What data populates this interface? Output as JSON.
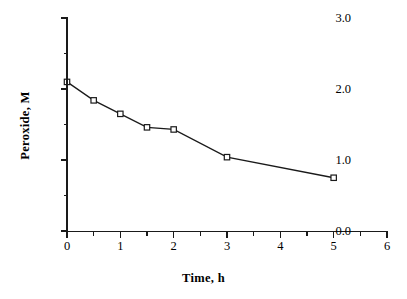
{
  "chart_data": {
    "type": "line",
    "title": "",
    "subtitle": "",
    "xlabel": "Time,  h",
    "ylabel": "Peroxide,  M",
    "xlim": [
      0,
      6
    ],
    "ylim": [
      0,
      3.0
    ],
    "grid": false,
    "legend": null,
    "x_ticks": [
      "0",
      "1",
      "2",
      "3",
      "4",
      "5",
      "6"
    ],
    "x_tick_values": [
      0,
      1,
      2,
      3,
      4,
      5,
      6
    ],
    "x_minor_tick_values": [
      0.5,
      1.5,
      2.5,
      3.5,
      4.5,
      5.5
    ],
    "y_ticks": [
      "0.0",
      "1.0",
      "2.0",
      "3.0"
    ],
    "y_tick_values": [
      0.0,
      1.0,
      2.0,
      3.0
    ],
    "y_minor_tick_values": [
      0.5,
      1.5,
      2.5
    ],
    "marker": "open-square",
    "line_color": "#1a1a1a",
    "marker_face_color": "#ffffff",
    "marker_edge_color": "#1a1a1a",
    "series": [
      {
        "name": "Peroxide",
        "x": [
          0,
          0.5,
          1,
          1.5,
          2,
          3,
          5
        ],
        "values": [
          2.1,
          1.84,
          1.65,
          1.46,
          1.43,
          1.04,
          0.75
        ]
      }
    ]
  }
}
